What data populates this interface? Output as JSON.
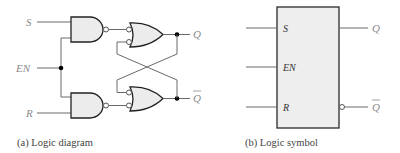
{
  "figure": {
    "panel_a": {
      "caption": "(a)  Logic diagram",
      "inputs": {
        "s": "S",
        "en": "EN",
        "r": "R"
      },
      "outputs": {
        "q": "Q",
        "q_bar": "Q"
      },
      "gates": [
        "NAND (S, EN)",
        "NAND (EN, R)",
        "OR with inverted inputs (upper)",
        "OR with inverted inputs (lower)"
      ]
    },
    "panel_b": {
      "caption": "(b)  Logic symbol",
      "inputs": {
        "s": "S",
        "en": "EN",
        "r": "R"
      },
      "outputs": {
        "q": "Q",
        "q_bar": "Q"
      }
    },
    "colors": {
      "gate_fill": "#ececec",
      "stroke": "#222222",
      "label": "#8a8a8a"
    }
  }
}
